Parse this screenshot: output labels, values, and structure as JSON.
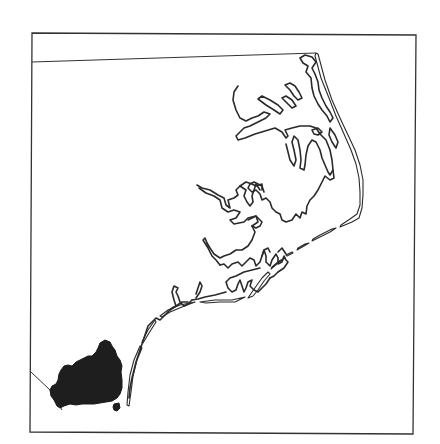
{
  "map": {
    "region": "Coastal North Carolina",
    "highlighted_area": {
      "name": "Brunswick County",
      "fill_color": "#1e1e1e"
    },
    "colors": {
      "background": "#ffffff",
      "outline": "#2a2a2a",
      "frame": "#333333"
    },
    "frame": {
      "x": 31,
      "y": 34,
      "width": 384,
      "height": 399
    }
  }
}
